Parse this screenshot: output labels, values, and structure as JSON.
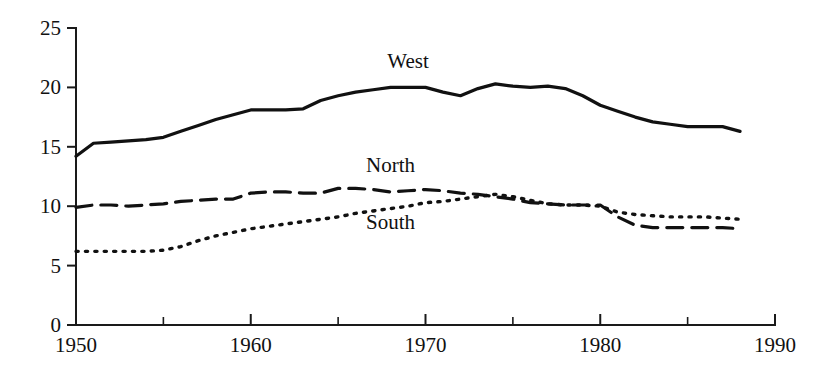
{
  "chart_data": {
    "type": "line",
    "title": "",
    "subtitle": "",
    "xlabel": "",
    "ylabel": "",
    "xlim": [
      1950,
      1990
    ],
    "ylim": [
      0,
      25
    ],
    "grid": false,
    "legend_position": "inline-annotations",
    "x_ticks_major": [
      "1950",
      "1960",
      "1970",
      "1980",
      "1990"
    ],
    "x_ticks_major_values": [
      1950,
      1960,
      1970,
      1980,
      1990
    ],
    "x_ticks_minor_values": [
      1955,
      1965,
      1975,
      1985
    ],
    "y_ticks": [
      "0",
      "5",
      "10",
      "15",
      "20",
      "25"
    ],
    "y_ticks_values": [
      0,
      5,
      10,
      15,
      20,
      25
    ],
    "x": [
      1950,
      1951,
      1952,
      1953,
      1954,
      1955,
      1956,
      1957,
      1958,
      1959,
      1960,
      1961,
      1962,
      1963,
      1964,
      1965,
      1966,
      1967,
      1968,
      1969,
      1970,
      1971,
      1972,
      1973,
      1974,
      1975,
      1976,
      1977,
      1978,
      1979,
      1980,
      1981,
      1982,
      1983,
      1984,
      1985,
      1986,
      1987,
      1988
    ],
    "series": [
      {
        "name": "West",
        "style": "solid",
        "label_x": 1969,
        "label_y": 21.6,
        "values": [
          14.2,
          15.3,
          15.4,
          15.5,
          15.6,
          15.8,
          16.3,
          16.8,
          17.3,
          17.7,
          18.1,
          18.1,
          18.1,
          18.2,
          18.9,
          19.3,
          19.6,
          19.8,
          20.0,
          20.0,
          20.0,
          19.6,
          19.3,
          19.9,
          20.3,
          20.1,
          20.0,
          20.1,
          19.9,
          19.3,
          18.5,
          18.0,
          17.5,
          17.1,
          16.9,
          16.7,
          16.7,
          16.7,
          16.3
        ]
      },
      {
        "name": "North",
        "style": "dashed",
        "label_x": 1968,
        "label_y": 12.9,
        "values": [
          9.9,
          10.1,
          10.1,
          10.0,
          10.1,
          10.2,
          10.4,
          10.5,
          10.6,
          10.6,
          11.1,
          11.2,
          11.2,
          11.1,
          11.1,
          11.5,
          11.5,
          11.4,
          11.2,
          11.3,
          11.4,
          11.3,
          11.1,
          11.0,
          10.8,
          10.6,
          10.3,
          10.2,
          10.1,
          10.1,
          10.1,
          9.1,
          8.4,
          8.2,
          8.2,
          8.2,
          8.2,
          8.2,
          8.1
        ]
      },
      {
        "name": "South",
        "style": "dotted",
        "label_x": 1968,
        "label_y": 8.1,
        "values": [
          6.2,
          6.2,
          6.2,
          6.2,
          6.2,
          6.3,
          6.6,
          7.1,
          7.5,
          7.8,
          8.1,
          8.3,
          8.5,
          8.7,
          8.9,
          9.1,
          9.4,
          9.6,
          9.8,
          10.0,
          10.3,
          10.4,
          10.6,
          10.8,
          11.0,
          10.8,
          10.5,
          10.2,
          10.1,
          10.1,
          10.0,
          9.5,
          9.3,
          9.2,
          9.1,
          9.1,
          9.1,
          9.0,
          8.9
        ]
      }
    ],
    "colors": {
      "line": "#111111",
      "axis": "#1a1a1a",
      "background": "#ffffff"
    }
  }
}
